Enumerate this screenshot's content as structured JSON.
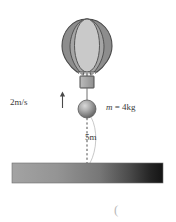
{
  "figure": {
    "labels": {
      "velocity": "2m/s",
      "mass_symbol": "m",
      "mass_equals": " = ",
      "mass_value": "4kg",
      "height": "5m",
      "stray_paren": "("
    },
    "colors": {
      "outline": "#4a4a4a",
      "balloon_center_gore": "#c9c9c9",
      "balloon_mid_gore": "#9e9e9e",
      "balloon_outer_gore": "#8a8a8a",
      "basket": "#a8a8a8",
      "ball_light": "#cfcfcf",
      "ball_dark": "#6a6a6a",
      "ground_light": "#9c9c9c",
      "ground_dark": "#1a1a1a",
      "dash_line": "#555555",
      "arc": "#bdbdbd",
      "text": "#3a3a3a",
      "paren": "#b9b9b9",
      "background": "#ffffff"
    },
    "geometry": {
      "balloon_center_x": 87,
      "balloon_top_y": 19,
      "balloon_bottom_y": 72,
      "balloon_half_width": 25,
      "basket_x": 80,
      "basket_y": 76,
      "basket_w": 14,
      "basket_h": 12,
      "ball_center_x": 87,
      "ball_center_y": 109,
      "ball_radius": 9,
      "ground_x": 12,
      "ground_y": 163,
      "ground_w": 151,
      "ground_h": 20,
      "drop_line_top_y": 118,
      "drop_line_bottom_y": 163
    }
  }
}
